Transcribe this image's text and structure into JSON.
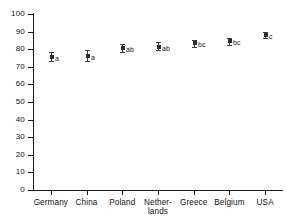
{
  "chart_data": {
    "type": "scatter",
    "title": "",
    "xlabel": "",
    "ylabel": "",
    "ylim": [
      0,
      100
    ],
    "y_ticks": [
      0,
      10,
      20,
      30,
      40,
      50,
      60,
      70,
      80,
      90,
      100
    ],
    "grid": false,
    "legend": null,
    "categories": [
      "Germany",
      "China",
      "Poland",
      "Nether-\nlands",
      "Greece",
      "Belgium",
      "USA"
    ],
    "category_labels_display": [
      "Germany",
      "China",
      "Poland",
      "Nether-\nlands",
      "Greece",
      "Belgium",
      "USA"
    ],
    "values": [
      75.5,
      76.0,
      80.5,
      81.5,
      83.5,
      84.5,
      88.0
    ],
    "error_low": [
      73.5,
      73.5,
      78.5,
      79.5,
      81.5,
      82.5,
      86.5
    ],
    "error_high": [
      78.5,
      79.5,
      83.0,
      84.0,
      85.5,
      86.5,
      89.5
    ],
    "annotations": [
      "a",
      "a",
      "ab",
      "ab",
      "bc",
      "bc",
      "c"
    ],
    "series": [
      {
        "name": "mean with error bars",
        "values": [
          75.5,
          76.0,
          80.5,
          81.5,
          83.5,
          84.5,
          88.0
        ]
      }
    ]
  },
  "style": {
    "axis_color": "#1a1a1a",
    "marker_color": "#2b2b2b",
    "errorbar_color": "#3c3c3c",
    "background": "#ffffff"
  }
}
